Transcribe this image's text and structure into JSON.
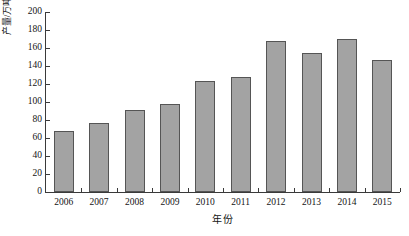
{
  "chart_data": {
    "type": "bar",
    "title": "",
    "xlabel": "年份",
    "ylabel": "产量/万吨",
    "categories": [
      "2006",
      "2007",
      "2008",
      "2009",
      "2010",
      "2011",
      "2012",
      "2013",
      "2014",
      "2015"
    ],
    "values": [
      68,
      77,
      91,
      98,
      123,
      128,
      168,
      154,
      170,
      147
    ],
    "ylim": [
      0,
      200
    ],
    "ytick_values": [
      0,
      20,
      40,
      60,
      80,
      100,
      120,
      140,
      160,
      180,
      200
    ],
    "ytick_labels": [
      "0",
      "20",
      "40",
      "60",
      "80",
      "100",
      "120",
      "140",
      "160",
      "180",
      "200"
    ],
    "grid": false,
    "legend": false,
    "legend_position": "none",
    "bar_fill_color": "#a3a3a3",
    "bar_edge_color": "#555555",
    "axis_color": "#3a3a3a",
    "background_color": "#ffffff"
  }
}
